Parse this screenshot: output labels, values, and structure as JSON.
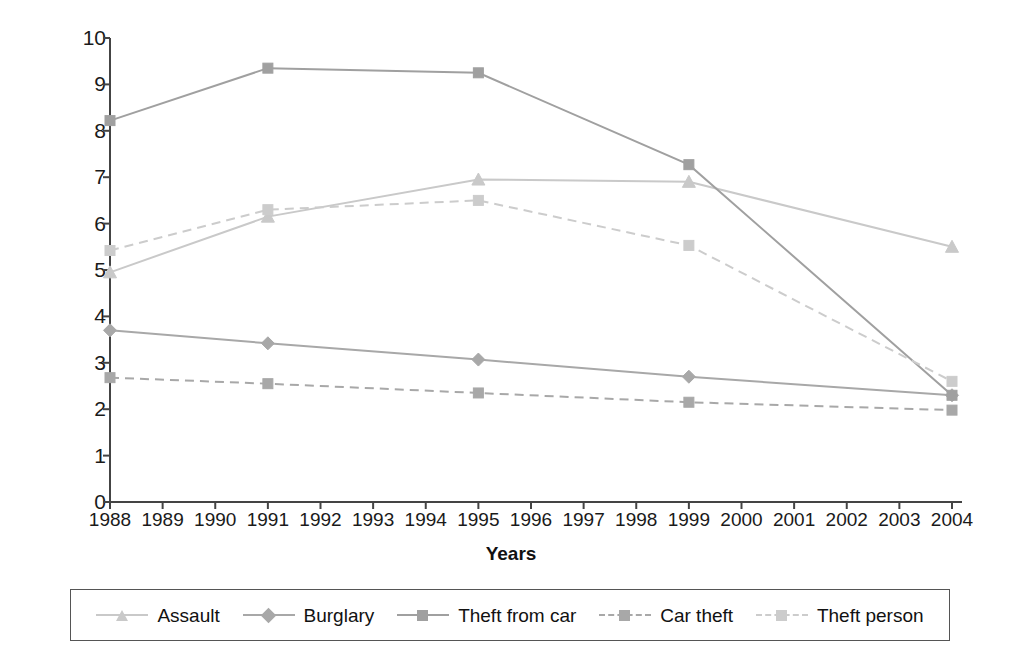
{
  "chart_data": {
    "type": "line",
    "title": "",
    "xlabel": "Years",
    "ylabel": "Number of Crimes per 100",
    "xlim": [
      1988,
      2004
    ],
    "ylim": [
      0,
      10
    ],
    "ytick_step": 1,
    "grid": false,
    "legend_position": "bottom",
    "x": [
      1988,
      1991,
      1995,
      1999,
      2004
    ],
    "xtick_labels": [
      "1988",
      "1989",
      "1990",
      "1991",
      "1992",
      "1993",
      "1994",
      "1995",
      "1996",
      "1997",
      "1998",
      "1999",
      "2000",
      "2001",
      "2002",
      "2003",
      "2004"
    ],
    "ytick_labels": [
      "0",
      "1",
      "2",
      "3",
      "4",
      "5",
      "6",
      "7",
      "8",
      "9",
      "10"
    ],
    "series": [
      {
        "name": "Assault",
        "values": [
          4.95,
          6.15,
          6.95,
          6.9,
          5.5
        ],
        "marker": "triangle",
        "line_style": "solid",
        "color": "#c9c9c9"
      },
      {
        "name": "Burglary",
        "values": [
          3.7,
          3.42,
          3.07,
          2.7,
          2.3
        ],
        "marker": "diamond",
        "line_style": "solid",
        "color": "#a8a8a8"
      },
      {
        "name": "Theft from car",
        "values": [
          8.22,
          9.35,
          9.25,
          7.27,
          2.3
        ],
        "marker": "square",
        "line_style": "solid",
        "color": "#a0a0a0"
      },
      {
        "name": "Car theft",
        "values": [
          2.68,
          2.55,
          2.35,
          2.15,
          1.98
        ],
        "marker": "square",
        "line_style": "dashed",
        "color": "#a8a8a8"
      },
      {
        "name": "Theft person",
        "values": [
          5.42,
          6.3,
          6.5,
          5.53,
          2.6
        ],
        "marker": "square",
        "line_style": "dashed",
        "color": "#cccccc"
      }
    ]
  },
  "axis": {
    "color": "#444444"
  }
}
